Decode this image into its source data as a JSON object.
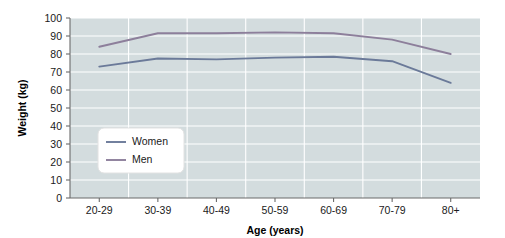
{
  "chart_data": {
    "type": "line",
    "title": "",
    "xlabel": "Age (years)",
    "ylabel": "Weight (kg)",
    "categories": [
      "20-29",
      "30-39",
      "40-49",
      "50-59",
      "60-69",
      "70-79",
      "80+"
    ],
    "series": [
      {
        "name": "Women",
        "color": "#6b7a99",
        "values": [
          73,
          77.5,
          77,
          78,
          78.5,
          76,
          64
        ]
      },
      {
        "name": "Men",
        "color": "#8d7f9b",
        "values": [
          84,
          91.5,
          91.5,
          92,
          91.5,
          88,
          80
        ]
      }
    ],
    "ylim": [
      0,
      100
    ],
    "ytick_values": [
      0,
      10,
      20,
      30,
      40,
      50,
      60,
      70,
      80,
      90,
      100
    ],
    "ytick_labels": [
      "0",
      "10",
      "20",
      "30",
      "40",
      "50",
      "60",
      "70",
      "80",
      "90",
      "100"
    ],
    "grid": true,
    "grid_axis": "both",
    "legend_position": "lower-left-inside",
    "plot_background": "#d3dcde",
    "page_background": "#ffffff",
    "gridline_color": "#ffffff",
    "axis_color": "#6b6b6b"
  }
}
